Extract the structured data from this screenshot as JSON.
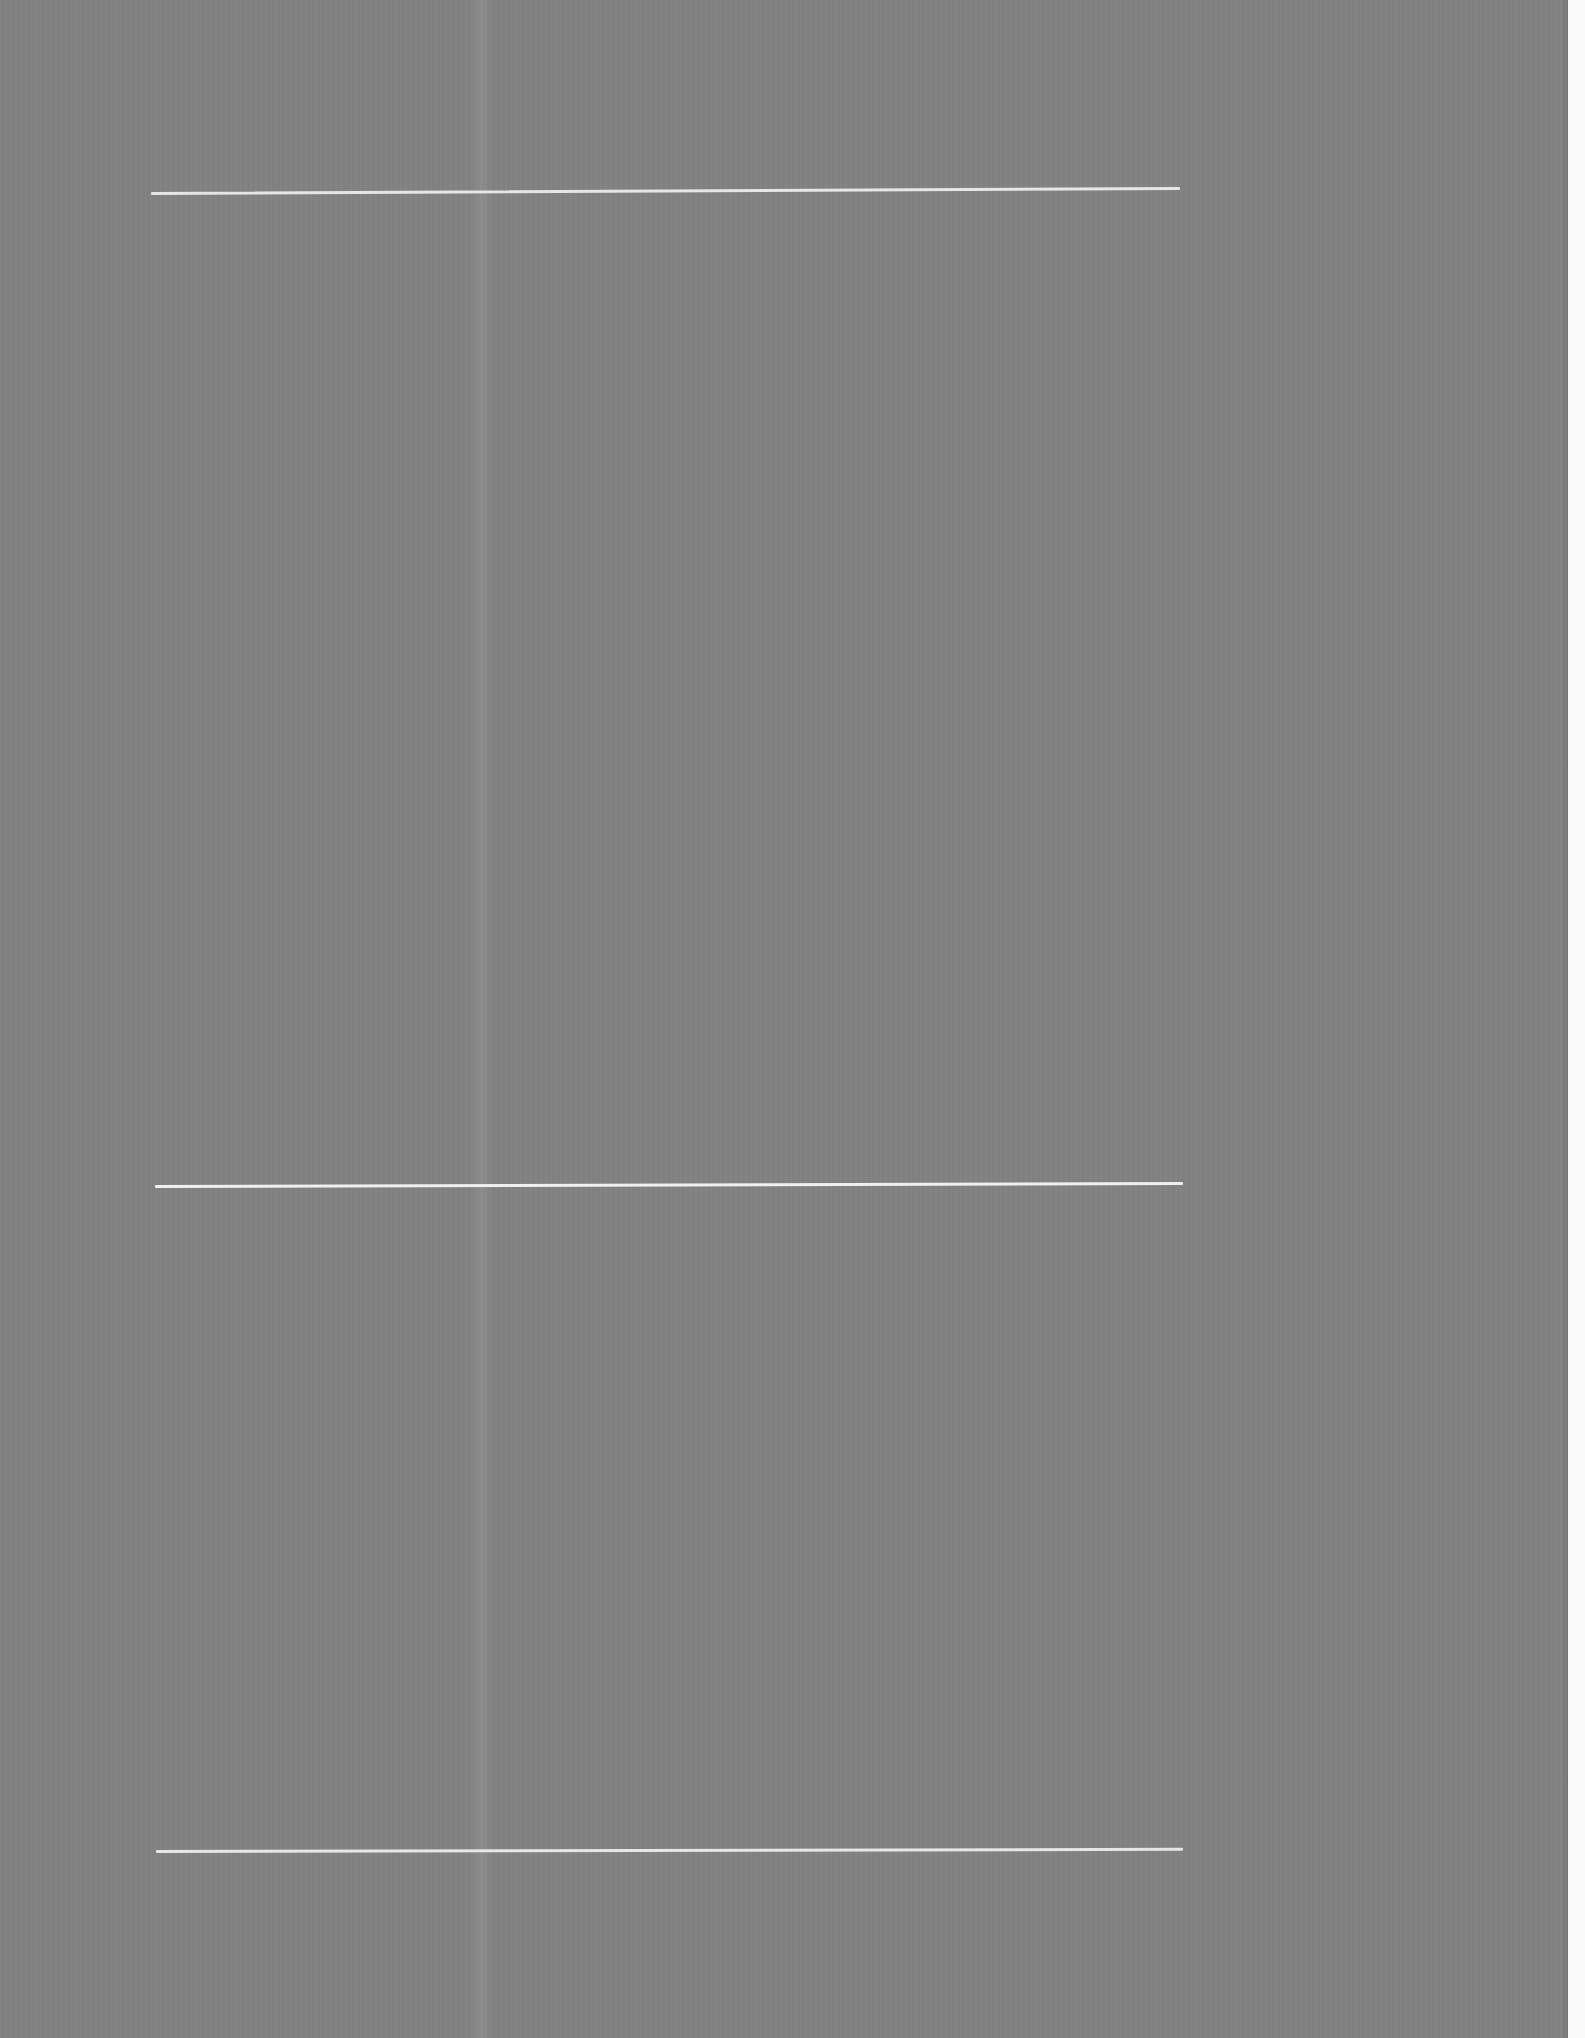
{
  "document": {
    "type": "scanned-page",
    "text_content": "",
    "colors": {
      "page_background": "#828282",
      "rule_color": "#e6e6e6",
      "margin_color": "#fbfbfb"
    },
    "rules": [
      {
        "name": "top-rule",
        "y": 192
      },
      {
        "name": "middle-rule",
        "y": 1185
      },
      {
        "name": "bottom-rule",
        "y": 1850
      }
    ]
  }
}
